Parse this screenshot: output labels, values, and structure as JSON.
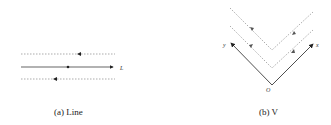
{
  "figures": [
    {
      "id": "a",
      "caption": "(a) Line",
      "labels": {
        "line": "L"
      },
      "elements": {
        "solid_line": {
          "direction": "right",
          "marker": "dot at center",
          "label": "L"
        },
        "dashed_upper": {
          "arrow": "left"
        },
        "dashed_lower": {
          "arrow": "left"
        }
      }
    },
    {
      "id": "b",
      "caption": "(b) V",
      "labels": {
        "origin": "O",
        "x_axis": "x",
        "y_axis": "y"
      },
      "elements": {
        "solid_v": {
          "vertex": "O",
          "arms": [
            "x",
            "y"
          ]
        },
        "dashed_inner_v": {
          "arrows": "toward upper-left on left arm, toward upper-right on right arm"
        },
        "dashed_outer_v": {
          "arrows": "toward vertex"
        }
      }
    }
  ],
  "colors": {
    "line": "#222222",
    "dashed": "#777777",
    "text": "#222222"
  }
}
